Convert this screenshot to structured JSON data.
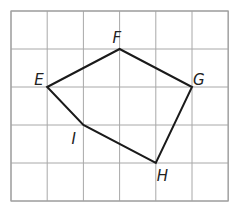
{
  "diagram": {
    "type": "polygon-on-grid",
    "grid": {
      "columns": 6,
      "rows": 5,
      "left": 11,
      "top": 11,
      "cell_w": 36.2,
      "cell_h": 38
    },
    "vertices": [
      {
        "label": "E",
        "gx": 1,
        "gy": 2,
        "lx": -13,
        "ly": -2
      },
      {
        "label": "F",
        "gx": 3,
        "gy": 1,
        "lx": -7,
        "ly": -6
      },
      {
        "label": "G",
        "gx": 5,
        "gy": 2,
        "lx": 1,
        "ly": -2
      },
      {
        "label": "H",
        "gx": 4,
        "gy": 4,
        "lx": 1,
        "ly": 18
      },
      {
        "label": "I",
        "gx": 2,
        "gy": 3,
        "lx": -12,
        "ly": 19
      }
    ],
    "polygon_order": [
      "E",
      "F",
      "G",
      "H",
      "I"
    ],
    "colors": {
      "grid": "#a8a8a8",
      "polygon": "#1a1a1a",
      "label": "#222222"
    }
  }
}
